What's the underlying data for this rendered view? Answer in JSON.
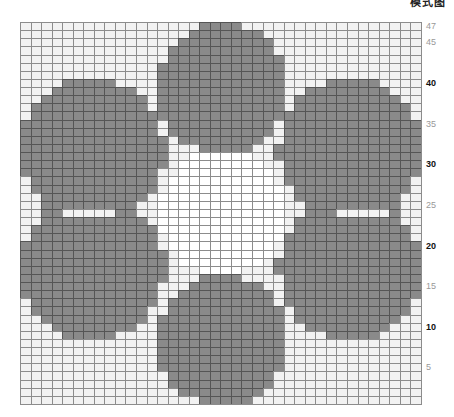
{
  "header": {
    "title": "模式图"
  },
  "pattern": {
    "cols": 38,
    "rows": 47,
    "cell_w": 10.55,
    "cell_h": 8.13,
    "colors": {
      "filled": "#8a8a8a",
      "empty": "#f2f2f2",
      "center": "#ffffff",
      "line": "#8c8c8c"
    },
    "petals": [
      {
        "name": "top",
        "cx": 202,
        "cy": 66,
        "r": 66
      },
      {
        "name": "upper-left",
        "cx": 72,
        "cy": 128,
        "r": 72
      },
      {
        "name": "upper-right",
        "cx": 330,
        "cy": 128,
        "r": 72
      },
      {
        "name": "lower-left",
        "cx": 72,
        "cy": 246,
        "r": 72
      },
      {
        "name": "lower-right",
        "cx": 330,
        "cy": 246,
        "r": 72
      },
      {
        "name": "bottom",
        "cx": 202,
        "cy": 318,
        "r": 66
      }
    ],
    "center": {
      "cx": 202,
      "cy": 190,
      "r": 63
    },
    "gaps": [
      {
        "x0": 45,
        "x1": 90,
        "y": 188
      },
      {
        "x0": 320,
        "x1": 365,
        "y": 188
      }
    ]
  },
  "axis": {
    "ticks": [
      {
        "label": "47",
        "row": 47,
        "major": false
      },
      {
        "label": "45",
        "row": 45,
        "major": false
      },
      {
        "label": "40",
        "row": 40,
        "major": true
      },
      {
        "label": "35",
        "row": 35,
        "major": false
      },
      {
        "label": "30",
        "row": 30,
        "major": true
      },
      {
        "label": "25",
        "row": 25,
        "major": false
      },
      {
        "label": "20",
        "row": 20,
        "major": true
      },
      {
        "label": "15",
        "row": 15,
        "major": false
      },
      {
        "label": "10",
        "row": 10,
        "major": true
      },
      {
        "label": "5",
        "row": 5,
        "major": false
      }
    ]
  }
}
